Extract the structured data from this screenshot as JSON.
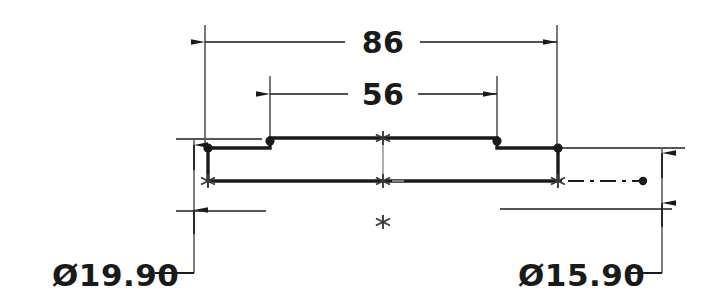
{
  "drawing": {
    "title": "Mechanical part section view",
    "background_color": "#ffffff",
    "line_color": "#1a1a1a",
    "thin_line_color": "#555555",
    "dimensions": [
      {
        "id": "overall-width",
        "label": "86",
        "type": "linear-horizontal",
        "text_x": 383,
        "text_y": 52,
        "line_y": 42,
        "left_x": 205,
        "right_x": 557,
        "ext_top_y": 25,
        "gap_left": 345,
        "gap_right": 420
      },
      {
        "id": "step-width",
        "label": "56",
        "type": "linear-horizontal",
        "text_x": 383,
        "text_y": 104,
        "line_y": 94,
        "left_x": 270,
        "right_x": 497,
        "ext_top_y": 76,
        "gap_left": 348,
        "gap_right": 418
      },
      {
        "id": "diameter-left",
        "label": "Ø19.90",
        "type": "diameter-leader",
        "text_x": 52,
        "text_y": 285,
        "leader_h_y": 273,
        "leader_h_x1": 155,
        "leader_h_x2": 194,
        "leader_v_x": 194,
        "leader_v_y1": 273,
        "leader_v_y2": 145,
        "arrow_top_y": 145,
        "arrow_bottom_y": 210,
        "ext_top_y": 139,
        "ext_bottom_y": 211
      },
      {
        "id": "diameter-right",
        "label": "Ø15.90",
        "type": "diameter-leader",
        "text_x": 518,
        "text_y": 285,
        "leader_h_y": 273,
        "leader_h_x1": 625,
        "leader_h_x2": 662,
        "leader_v_x": 662,
        "leader_v_y1": 273,
        "leader_v_y2": 152,
        "arrow_top_y": 152,
        "arrow_bottom_y": 203,
        "ext_top_y": 148,
        "ext_bottom_y": 209
      }
    ],
    "profile": {
      "description": "Stepped shaft outline, section view",
      "top_y_outer": 148,
      "top_y_step": 138,
      "bottom_y": 181,
      "left_x": 208,
      "step_left_x": 270,
      "step_right_x": 497,
      "right_x": 558
    },
    "centerline": {
      "y": 181,
      "x_start": 558,
      "x_end": 643,
      "end_dot_x": 643,
      "style": "dash-dot"
    },
    "snap_markers": [
      {
        "id": "marker-top-center",
        "x": 383,
        "y": 138
      },
      {
        "id": "marker-mid-center",
        "x": 383,
        "y": 181
      },
      {
        "id": "marker-bottom-left",
        "x": 208,
        "y": 181
      },
      {
        "id": "marker-bottom-right",
        "x": 558,
        "y": 181
      },
      {
        "id": "marker-free",
        "x": 383,
        "y": 222
      }
    ],
    "vertex_dots": [
      {
        "id": "dot-left-top",
        "x": 208,
        "y": 148
      },
      {
        "id": "dot-step-left-top",
        "x": 270,
        "y": 138
      },
      {
        "id": "dot-step-right-top",
        "x": 497,
        "y": 138
      },
      {
        "id": "dot-right-top",
        "x": 558,
        "y": 148
      },
      {
        "id": "dot-centerline-end",
        "x": 643,
        "y": 181
      }
    ]
  }
}
